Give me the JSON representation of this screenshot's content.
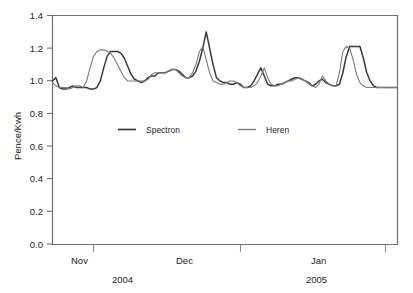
{
  "chart_data": {
    "type": "line",
    "title": "",
    "subtitle": "",
    "xlabel": "",
    "ylabel": "Pence/Kwh",
    "ylim": [
      0.0,
      1.4
    ],
    "yticks": [
      0.0,
      0.2,
      0.4,
      0.6,
      0.8,
      1.0,
      1.2,
      1.4
    ],
    "ytick_labels": [
      "0.0",
      "0.2",
      "0.4",
      "0.6",
      "0.8",
      "1.0",
      "1.2",
      "1.4"
    ],
    "xtick_labels": [
      "Nov",
      "Dec",
      "Jan"
    ],
    "xtick_sublabels": [
      "2004",
      "2005"
    ],
    "grid": false,
    "legend_position": "inside-center",
    "axis_color": "#6e6e6e",
    "series": [
      {
        "name": "Spectron",
        "color": "#3a3a3a",
        "line_width": 1.5,
        "values": [
          1.0,
          1.02,
          0.96,
          0.95,
          0.95,
          0.96,
          0.97,
          0.96,
          0.96,
          0.96,
          0.96,
          0.95,
          0.95,
          0.96,
          1.0,
          1.08,
          1.15,
          1.18,
          1.18,
          1.18,
          1.17,
          1.14,
          1.09,
          1.04,
          1.01,
          1.0,
          0.99,
          1.0,
          1.02,
          1.03,
          1.03,
          1.05,
          1.05,
          1.05,
          1.06,
          1.07,
          1.07,
          1.06,
          1.04,
          1.02,
          1.02,
          1.03,
          1.06,
          1.12,
          1.2,
          1.3,
          1.2,
          1.1,
          1.02,
          1.0,
          0.99,
          0.99,
          0.98,
          0.98,
          0.99,
          0.98,
          0.96,
          0.96,
          0.97,
          1.0,
          1.04,
          1.08,
          1.03,
          0.98,
          0.97,
          0.97,
          0.98,
          0.98,
          0.99,
          1.0,
          1.01,
          1.02,
          1.02,
          1.01,
          1.0,
          0.99,
          0.97,
          0.98,
          1.0,
          1.01,
          0.99,
          0.98,
          0.97,
          0.97,
          0.98,
          1.05,
          1.15,
          1.21,
          1.21,
          1.21,
          1.21,
          1.14,
          1.05,
          1.0,
          0.97,
          0.96,
          0.96,
          0.96,
          0.96,
          0.96,
          0.96,
          0.96
        ]
      },
      {
        "name": "Heren",
        "color": "#7a7a7a",
        "line_width": 1.1,
        "values": [
          0.99,
          0.97,
          0.96,
          0.96,
          0.96,
          0.95,
          0.96,
          0.97,
          0.97,
          0.96,
          1.0,
          1.08,
          1.15,
          1.18,
          1.19,
          1.19,
          1.18,
          1.17,
          1.14,
          1.1,
          1.06,
          1.02,
          1.0,
          1.0,
          1.0,
          1.0,
          1.0,
          1.0,
          1.01,
          1.04,
          1.05,
          1.05,
          1.05,
          1.05,
          1.06,
          1.07,
          1.07,
          1.05,
          1.03,
          1.02,
          1.02,
          1.05,
          1.1,
          1.18,
          1.21,
          1.13,
          1.05,
          1.0,
          0.99,
          0.98,
          0.98,
          0.99,
          1.0,
          1.0,
          0.99,
          0.97,
          0.96,
          0.96,
          0.96,
          0.97,
          0.99,
          1.03,
          1.08,
          1.02,
          0.98,
          0.97,
          0.97,
          0.98,
          0.99,
          1.0,
          1.0,
          1.01,
          1.02,
          1.01,
          1.0,
          0.98,
          0.97,
          0.96,
          0.98,
          1.03,
          1.0,
          0.98,
          0.97,
          0.97,
          1.05,
          1.18,
          1.21,
          1.2,
          1.13,
          1.04,
          0.99,
          0.97,
          0.96,
          0.96,
          0.96,
          0.96,
          0.96,
          0.96,
          0.96,
          0.96,
          0.96,
          0.96
        ]
      }
    ],
    "legend": [
      {
        "label": "Spectron",
        "color": "#3a3a3a"
      },
      {
        "label": "Heren",
        "color": "#7a7a7a"
      }
    ]
  },
  "axis": {
    "y_label": "Pence/Kwh",
    "y_ticks": [
      "1.4",
      "1.2",
      "1.0",
      "0.8",
      "0.6",
      "0.4",
      "0.2",
      "0.0"
    ],
    "x_ticks": [
      {
        "label": "Nov",
        "year": "2004"
      },
      {
        "label": "Dec",
        "year": ""
      },
      {
        "label": "Jan",
        "year": "2005"
      }
    ]
  },
  "legend": {
    "spectron_label": "Spectron",
    "heren_label": "Heren"
  }
}
